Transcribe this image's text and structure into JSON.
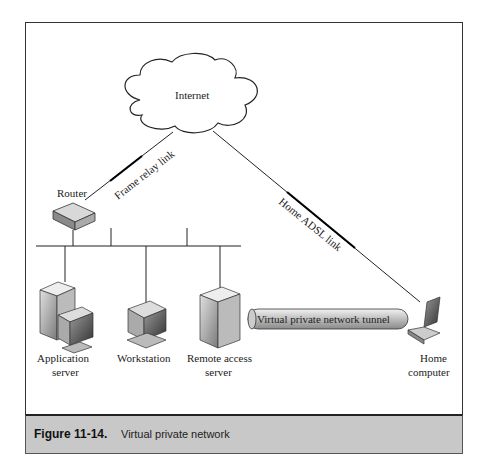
{
  "diagram": {
    "cloud": {
      "label": "Internet"
    },
    "router": {
      "label": "Router"
    },
    "links": {
      "frame_relay": "Frame relay link",
      "adsl": "Home ADSL link"
    },
    "nodes": {
      "application_server": {
        "line1": "Application",
        "line2": "server"
      },
      "workstation": {
        "line1": "Workstation"
      },
      "remote_access": {
        "line1": "Remote access",
        "line2": "server"
      },
      "home_computer": {
        "line1": "Home",
        "line2": "computer"
      }
    },
    "tunnel": {
      "label": "Virtual private network tunnel"
    }
  },
  "caption": {
    "number": "Figure 11-14.",
    "text": "Virtual private network"
  }
}
